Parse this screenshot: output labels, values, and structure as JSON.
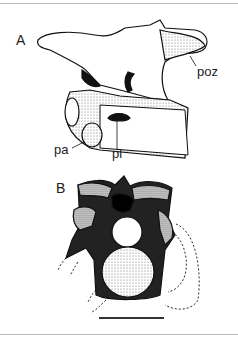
{
  "figure": {
    "panels": [
      {
        "id": "A",
        "label": "A",
        "annotations": [
          "poz",
          "pa",
          "pl"
        ]
      },
      {
        "id": "B",
        "label": "B",
        "annotations": []
      }
    ],
    "labels": {
      "panel_a": "A",
      "panel_b": "B",
      "poz": "poz",
      "pa": "pa",
      "pl": "pl"
    },
    "scale_bar": {
      "present": true
    },
    "colors": {
      "ink": "#111111",
      "paper": "#ffffff",
      "rule": "#bdbdbd"
    }
  }
}
